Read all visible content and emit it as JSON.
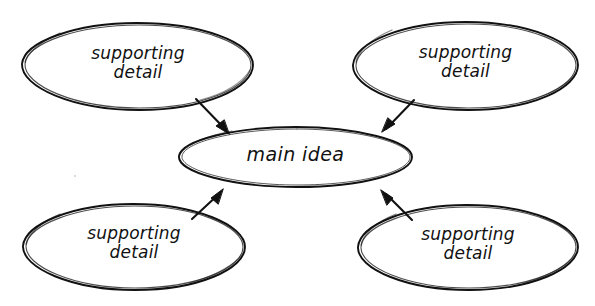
{
  "diagram": {
    "type": "concept-map",
    "style": "hand-drawn sketch, black ink on white paper",
    "background_color": "#ffffff",
    "ink_color": "#111111",
    "canvas": {
      "width": 595,
      "height": 306
    },
    "nodes": [
      {
        "id": "top-left",
        "label": "supporting\ndetail",
        "shape": "ellipse",
        "cx": 138,
        "cy": 66,
        "rx": 116,
        "ry": 44
      },
      {
        "id": "top-right",
        "label": "supporting\ndetail",
        "shape": "ellipse",
        "cx": 466,
        "cy": 66,
        "rx": 113,
        "ry": 44
      },
      {
        "id": "center",
        "label": "main idea",
        "shape": "ellipse",
        "cx": 295,
        "cy": 157,
        "rx": 117,
        "ry": 30
      },
      {
        "id": "bottom-left",
        "label": "supporting\ndetail",
        "shape": "ellipse",
        "cx": 134,
        "cy": 247,
        "rx": 112,
        "ry": 43
      },
      {
        "id": "bottom-right",
        "label": "supporting\ndetail",
        "shape": "ellipse",
        "cx": 468,
        "cy": 247,
        "rx": 111,
        "ry": 43
      }
    ],
    "arrows": [
      {
        "id": "arrow-top-left-to-center",
        "from": "top-left",
        "to": "center",
        "direction": "down-right",
        "head_x": 228,
        "head_y": 133
      },
      {
        "id": "arrow-top-right-to-center",
        "from": "top-right",
        "to": "center",
        "direction": "down-left",
        "head_x": 383,
        "head_y": 131
      },
      {
        "id": "arrow-bottom-left-to-center",
        "from": "bottom-left",
        "to": "center",
        "direction": "up-right",
        "head_x": 222,
        "head_y": 190
      },
      {
        "id": "arrow-bottom-right-to-center",
        "from": "bottom-right",
        "to": "center",
        "direction": "up-left",
        "head_x": 382,
        "head_y": 190
      }
    ]
  }
}
